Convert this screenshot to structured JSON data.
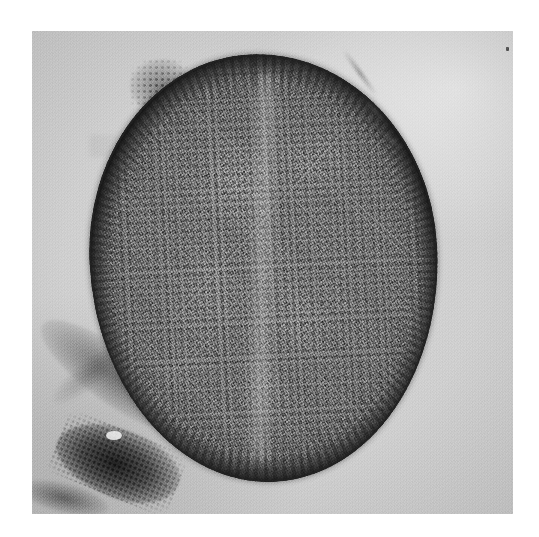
{
  "figure": {
    "kind": "electron-micrograph",
    "modality": "transmission electron microscopy (TEM)",
    "orientation": "single centered panel on white page",
    "alt_text": "Transmission electron micrograph showing a roughly circular bacterial cell with a dark cell envelope, densely granular ribosome-rich cytoplasm and lighter nucleoid regions, set against a pale gray support film; dark cellular debris lies at the lower left."
  },
  "page": {
    "background_color": "#ffffff",
    "width_px": 539,
    "height_px": 537
  },
  "panel": {
    "left_px": 32,
    "top_px": 31,
    "width_px": 481,
    "height_px": 483,
    "background_color": "#d2d2d2",
    "grain": "fine photographic film grain",
    "label": ""
  },
  "cell": {
    "name": "bacterial-cell",
    "shape": "near-circular / slightly ovoid section",
    "center_x_px": 264,
    "center_y_px": 268,
    "width_px": 348,
    "height_px": 428,
    "envelope_color": "#282828",
    "cytoplasm_color": "#7d7d7d",
    "nucleoid_color": "#c8c8c8",
    "features": [
      "dark, sharply defined outer cell envelope",
      "radially striated envelope texture along the upper rim",
      "dense granular ribosome-rich cytoplasm",
      "irregular lighter nucleoid (DNA) patches toward the center",
      "faint pale axial band suggesting an incipient division furrow"
    ]
  },
  "extracellular": {
    "items": [
      {
        "name": "capsule-blob",
        "description": "fuzzy granular capsular/appendage material on the upper-left cell surface",
        "left_px": 130,
        "top_px": 59
      },
      {
        "name": "filament-streaks",
        "description": "faint diagonal fibrous streaks in the support film above the upper-right rim",
        "left_px": 332,
        "top_px": 71
      },
      {
        "name": "debris-streak",
        "description": "broad diagonal smear of electron-lucent cellular debris at lower left",
        "left_px": 26,
        "top_px": 349
      },
      {
        "name": "debris-core",
        "description": "dense, very dark irregular mass of cellular debris at bottom left",
        "left_px": 54,
        "top_px": 429
      }
    ]
  },
  "colors": {
    "page_white": "#ffffff",
    "film_background": "#d2d2d2",
    "envelope_dark": "#282828",
    "cytoplasm_mid": "#7d7d7d",
    "nucleoid_light": "#c8c8c8",
    "debris_black": "#161616"
  },
  "annotations": {
    "scale_bar": "",
    "magnification": "",
    "labels": []
  }
}
